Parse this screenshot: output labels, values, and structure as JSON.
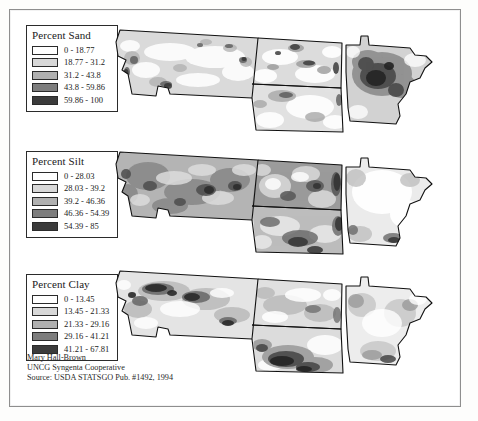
{
  "figure": {
    "region_states": [
      "Montana",
      "North Dakota",
      "South Dakota",
      "Minnesota"
    ],
    "caption_partial": ""
  },
  "panels": [
    {
      "id": "sand",
      "legend_title": "Percent Sand",
      "classes": [
        {
          "label": "0 - 18.77",
          "color": "#ffffff",
          "min": 0,
          "max": 18.77
        },
        {
          "label": "18.77 - 31.2",
          "color": "#d8d8d8",
          "min": 18.77,
          "max": 31.2
        },
        {
          "label": "31.2 - 43.8",
          "color": "#b0b0b0",
          "min": 31.2,
          "max": 43.8
        },
        {
          "label": "43.8 - 59.86",
          "color": "#7d7d7d",
          "min": 43.8,
          "max": 59.86
        },
        {
          "label": "59.86 - 100",
          "color": "#3b3b3b",
          "min": 59.86,
          "max": 100
        }
      ]
    },
    {
      "id": "silt",
      "legend_title": "Percent Silt",
      "classes": [
        {
          "label": "0 - 28.03",
          "color": "#ffffff",
          "min": 0,
          "max": 28.03
        },
        {
          "label": "28.03 - 39.2",
          "color": "#d8d8d8",
          "min": 28.03,
          "max": 39.2
        },
        {
          "label": "39.2 - 46.36",
          "color": "#b0b0b0",
          "min": 39.2,
          "max": 46.36
        },
        {
          "label": "46.36 - 54.39",
          "color": "#7d7d7d",
          "min": 46.36,
          "max": 54.39
        },
        {
          "label": "54.39 - 85",
          "color": "#3b3b3b",
          "min": 54.39,
          "max": 85
        }
      ]
    },
    {
      "id": "clay",
      "legend_title": "Percent Clay",
      "classes": [
        {
          "label": "0 - 13.45",
          "color": "#ffffff",
          "min": 0,
          "max": 13.45
        },
        {
          "label": "13.45 - 21.33",
          "color": "#d8d8d8",
          "min": 13.45,
          "max": 21.33
        },
        {
          "label": "21.33 - 29.16",
          "color": "#b0b0b0",
          "min": 21.33,
          "max": 29.16
        },
        {
          "label": "29.16 - 41.21",
          "color": "#7d7d7d",
          "min": 29.16,
          "max": 41.21
        },
        {
          "label": "41.21 - 67.81",
          "color": "#3b3b3b",
          "min": 41.21,
          "max": 67.81
        }
      ]
    }
  ],
  "credits": {
    "line1": "Mary Hall-Brown",
    "line2": "UNCG Syngenta Cooperative",
    "line3": "Source: USDA STATSGO Pub. #1492, 1994"
  }
}
